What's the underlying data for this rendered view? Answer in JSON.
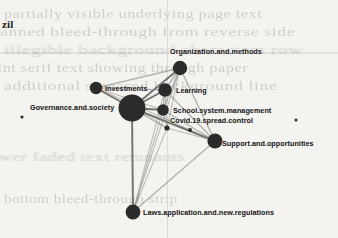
{
  "figure": {
    "corner_text": "zil",
    "background_note": "faint-scanned-bleed-through-text",
    "colors": {
      "page": "#f4f3f0",
      "node": "#2b2b2b",
      "edge": "#8d8b87",
      "edge_strong": "#5d5b57",
      "label": "#111111",
      "bleed": "#8f8c86"
    }
  },
  "bleed_text": {
    "lines": [
      "partially visible underlying page text",
      "scanned bleed-through from reverse side",
      "illegible background characters row",
      "faint serif text showing through paper",
      "additional smeared background line",
      "lower faded text remnants",
      "bottom bleed-through strip"
    ]
  },
  "chart_data": {
    "type": "network",
    "title": "",
    "node_label_key": "label",
    "nodes": [
      {
        "id": "governance",
        "label": "Governance.and.society",
        "x": 132,
        "y": 108,
        "r": 13.5,
        "label_x": 30,
        "label_y": 103,
        "size_rank": 1
      },
      {
        "id": "investments",
        "label": "Investments",
        "x": 96,
        "y": 88,
        "r": 6.2,
        "label_x": 105,
        "label_y": 84,
        "size_rank": 4
      },
      {
        "id": "organization",
        "label": "Organization.and.methods",
        "x": 180,
        "y": 68,
        "r": 7.2,
        "label_x": 170,
        "label_y": 47,
        "size_rank": 3
      },
      {
        "id": "learning",
        "label": "Learning",
        "x": 165,
        "y": 90,
        "r": 6.8,
        "label_x": 176,
        "label_y": 86,
        "size_rank": 3
      },
      {
        "id": "school",
        "label": "School.system.management",
        "x": 163,
        "y": 110,
        "r": 5.8,
        "label_x": 173,
        "label_y": 106,
        "size_rank": 5
      },
      {
        "id": "covid",
        "label": "Covid.19.spread.control",
        "x": 167,
        "y": 128,
        "r": 2.6,
        "label_x": 170,
        "label_y": 116,
        "size_rank": 7
      },
      {
        "id": "support",
        "label": "Support.and.opportunities",
        "x": 215,
        "y": 141,
        "r": 7.6,
        "label_x": 222,
        "label_y": 139,
        "size_rank": 2
      },
      {
        "id": "laws",
        "label": "Laws.application.and.new.regulations",
        "x": 133,
        "y": 212,
        "r": 7.4,
        "label_x": 143,
        "label_y": 208,
        "size_rank": 2
      }
    ],
    "stray_dots": [
      {
        "x": 22,
        "y": 117,
        "r": 1.6
      },
      {
        "x": 190,
        "y": 130,
        "r": 2.0
      },
      {
        "x": 296,
        "y": 120,
        "r": 1.5
      }
    ],
    "edges": [
      {
        "source": "governance",
        "target": "investments",
        "weight": 3
      },
      {
        "source": "governance",
        "target": "organization",
        "weight": 3
      },
      {
        "source": "governance",
        "target": "learning",
        "weight": 3
      },
      {
        "source": "governance",
        "target": "school",
        "weight": 3
      },
      {
        "source": "governance",
        "target": "covid",
        "weight": 2
      },
      {
        "source": "governance",
        "target": "support",
        "weight": 3
      },
      {
        "source": "governance",
        "target": "laws",
        "weight": 3
      },
      {
        "source": "investments",
        "target": "organization",
        "weight": 2
      },
      {
        "source": "investments",
        "target": "learning",
        "weight": 2
      },
      {
        "source": "investments",
        "target": "school",
        "weight": 1
      },
      {
        "source": "investments",
        "target": "support",
        "weight": 1
      },
      {
        "source": "organization",
        "target": "learning",
        "weight": 2
      },
      {
        "source": "organization",
        "target": "school",
        "weight": 2
      },
      {
        "source": "organization",
        "target": "covid",
        "weight": 1
      },
      {
        "source": "organization",
        "target": "support",
        "weight": 2
      },
      {
        "source": "organization",
        "target": "laws",
        "weight": 1
      },
      {
        "source": "learning",
        "target": "school",
        "weight": 2
      },
      {
        "source": "learning",
        "target": "covid",
        "weight": 1
      },
      {
        "source": "learning",
        "target": "support",
        "weight": 2
      },
      {
        "source": "learning",
        "target": "laws",
        "weight": 1
      },
      {
        "source": "school",
        "target": "covid",
        "weight": 1
      },
      {
        "source": "school",
        "target": "support",
        "weight": 2
      },
      {
        "source": "school",
        "target": "laws",
        "weight": 1
      },
      {
        "source": "covid",
        "target": "support",
        "weight": 1
      },
      {
        "source": "covid",
        "target": "laws",
        "weight": 1
      },
      {
        "source": "support",
        "target": "laws",
        "weight": 2
      }
    ],
    "legend": [],
    "xlabel": "",
    "ylabel": ""
  }
}
